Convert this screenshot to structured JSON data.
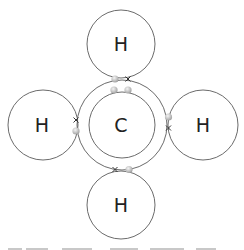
{
  "diagram": {
    "type": "dot-and-cross",
    "molecule_atoms": [
      "C",
      "H",
      "H",
      "H",
      "H"
    ],
    "colors": {
      "line": "#5a5a5a",
      "electron_dot": "#bdbdbd",
      "electron_dot_highlight": "#f2f2f2",
      "cross": "#333333",
      "text": "#222222"
    },
    "atoms": [
      {
        "id": "carbon",
        "symbol": "C",
        "cx": 121,
        "cy": 125,
        "r_outer": 44,
        "r_inner": 33
      },
      {
        "id": "h-top",
        "symbol": "H",
        "cx": 121,
        "cy": 44,
        "r": 35
      },
      {
        "id": "h-left",
        "symbol": "H",
        "cx": 43,
        "cy": 125,
        "r": 35
      },
      {
        "id": "h-right",
        "symbol": "H",
        "cx": 202,
        "cy": 125,
        "r": 35
      },
      {
        "id": "h-bottom",
        "symbol": "H",
        "cx": 121,
        "cy": 205,
        "r": 35
      }
    ],
    "bonds": [
      {
        "between": [
          "carbon",
          "h-top"
        ],
        "dot": [
          115,
          78
        ],
        "cross": [
          128,
          78
        ]
      },
      {
        "between": [
          "carbon",
          "h-left"
        ],
        "dot": [
          76,
          131
        ],
        "cross": [
          76,
          120
        ]
      },
      {
        "between": [
          "carbon",
          "h-right"
        ],
        "dot": [
          169,
          117
        ],
        "cross": [
          169,
          128
        ]
      },
      {
        "between": [
          "carbon",
          "h-bottom"
        ],
        "dot": [
          129,
          169
        ],
        "cross": [
          115,
          169
        ]
      }
    ],
    "inner_electrons": [
      [
        114,
        89
      ],
      [
        128,
        89
      ]
    ],
    "caption_cut_off": true
  }
}
